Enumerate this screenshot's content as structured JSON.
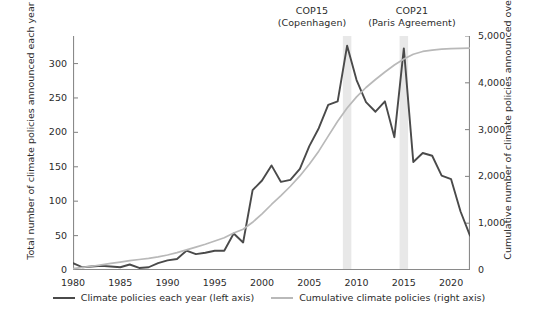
{
  "chart_data": {
    "type": "line",
    "title": "",
    "xlabel": "",
    "ylabel": "Total number of climate policies announced each year",
    "ylabel_right": "Cumulative number of climate policies announced over time",
    "xlim": [
      1980,
      2022
    ],
    "ylim": [
      0,
      340
    ],
    "ylim_right": [
      0,
      5000
    ],
    "grid": false,
    "legend_position": "bottom",
    "x": [
      1980,
      1981,
      1982,
      1983,
      1984,
      1985,
      1986,
      1987,
      1988,
      1989,
      1990,
      1991,
      1992,
      1993,
      1994,
      1995,
      1996,
      1997,
      1998,
      1999,
      2000,
      2001,
      2002,
      2003,
      2004,
      2005,
      2006,
      2007,
      2008,
      2009,
      2010,
      2011,
      2012,
      2013,
      2014,
      2015,
      2016,
      2017,
      2018,
      2019,
      2020,
      2021,
      2022
    ],
    "series": [
      {
        "name": "Climate policies each year (left axis)",
        "axis": "left",
        "color": "#4a4a4a",
        "values": [
          10,
          4,
          5,
          6,
          5,
          4,
          8,
          3,
          4,
          10,
          14,
          16,
          28,
          23,
          25,
          28,
          28,
          53,
          40,
          116,
          130,
          152,
          128,
          131,
          147,
          180,
          206,
          240,
          245,
          326,
          276,
          244,
          230,
          245,
          193,
          322,
          157,
          170,
          166,
          137,
          132,
          85,
          50
        ]
      },
      {
        "name": "Cumulative climate policies (right axis)",
        "axis": "right",
        "color": "#b9b9b9",
        "values": [
          30,
          55,
          80,
          110,
          140,
          170,
          200,
          225,
          250,
          280,
          320,
          370,
          430,
          490,
          550,
          620,
          690,
          790,
          870,
          1020,
          1200,
          1400,
          1590,
          1790,
          2010,
          2260,
          2540,
          2860,
          3180,
          3460,
          3700,
          3900,
          4070,
          4230,
          4380,
          4510,
          4610,
          4670,
          4700,
          4720,
          4730,
          4735,
          4740
        ]
      }
    ],
    "y_ticks_left": [
      0,
      50,
      100,
      150,
      200,
      250,
      300
    ],
    "y_ticks_right": [
      {
        "value": 0,
        "label": "0"
      },
      {
        "value": 1000,
        "label": "1,000"
      },
      {
        "value": 2000,
        "label": "2,000"
      },
      {
        "value": 3000,
        "label": "3,000"
      },
      {
        "value": 4000,
        "label": "4,000"
      },
      {
        "value": 5000,
        "label": "5,000"
      }
    ],
    "x_ticks": [
      1980,
      1985,
      1990,
      1995,
      2000,
      2005,
      2010,
      2015,
      2020
    ],
    "x_minor_ticks": [
      1980,
      1982.5,
      1985,
      1987.5,
      1990,
      1992.5,
      1995,
      1997.5,
      2000,
      2002.5,
      2005,
      2007.5,
      2010,
      2012.5,
      2015,
      2017.5,
      2020,
      2022.5
    ],
    "annotations": [
      {
        "id": "cop15",
        "line1": "COP15",
        "line2": "(Copenhagen)",
        "band_start": 2008.55,
        "band_end": 2009.45,
        "band_color": "#e8e8e8"
      },
      {
        "id": "cop21",
        "line1": "COP21",
        "line2": "(Paris Agreement)",
        "band_start": 2014.55,
        "band_end": 2015.45,
        "band_color": "#e8e8e8"
      }
    ],
    "legend": [
      {
        "label": "Climate policies each year (left axis)",
        "color": "#4a4a4a"
      },
      {
        "label": "Cumulative climate policies (right axis)",
        "color": "#b9b9b9"
      }
    ],
    "axis_color": "#8a8a8a"
  }
}
